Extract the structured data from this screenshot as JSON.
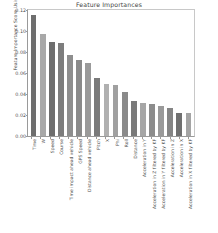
{
  "chart_data": {
    "type": "bar",
    "title": "Feature Importances",
    "xlabel": "",
    "ylabel": "Feature Importance Score Using Xgboost",
    "ylim": [
      0.0,
      0.12
    ],
    "yticks": [
      "0.00",
      "0.02",
      "0.04",
      "0.06",
      "0.08",
      "0.10",
      "0.12"
    ],
    "ytick_values": [
      0.0,
      0.02,
      0.04,
      0.06,
      0.08,
      0.1,
      0.12
    ],
    "grid": false,
    "legend": "none",
    "categories": [
      "Time",
      "W",
      "Speed",
      "Course",
      "Time impact ahead vehicle",
      "GPS Speed",
      "Distance ahead vehicle",
      "Pitch",
      "X",
      "Phi",
      "Roll",
      "Distance",
      "Acceleration in Y",
      "Acceleration in Z filtered by KF",
      "Acceleration in Y filtered by KF",
      "Acceleration in Z",
      "Acceleration in X",
      "Acceleration in X filtered by KF"
    ],
    "values": [
      0.1155,
      0.0973,
      0.0897,
      0.0886,
      0.0768,
      0.0727,
      0.0697,
      0.0554,
      0.0498,
      0.0484,
      0.0421,
      0.0338,
      0.0318,
      0.0305,
      0.0289,
      0.0266,
      0.0222,
      0.022
    ],
    "bar_colors": [
      "#6e6e6e",
      "#a8a8a8",
      "#6e6e6e",
      "#7d7d7d",
      "#8e8e8e",
      "#8a8a8a",
      "#9a9a9a",
      "#7a7a7a",
      "#b0b0b0",
      "#a0a0a0",
      "#8a8a8a",
      "#7a7a7a",
      "#a6a6a6",
      "#8c8c8c",
      "#9a9a9a",
      "#858585",
      "#707070",
      "#a4a4a4"
    ],
    "axis_color": "#9a9a9a"
  }
}
